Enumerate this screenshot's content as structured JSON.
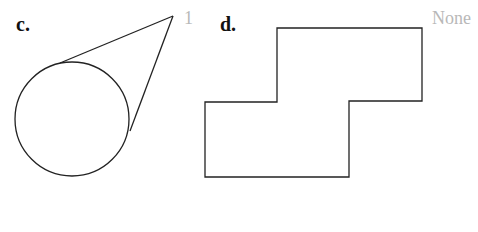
{
  "figures": [
    {
      "label": "c.",
      "answer": "1",
      "shape": "circle-with-two-tangent-lines",
      "circle": {
        "cx": 72,
        "cy": 119,
        "r": 57
      },
      "apex": [
        173,
        16
      ],
      "tangent_points": [
        [
          60,
          63
        ],
        [
          130,
          131
        ]
      ]
    },
    {
      "label": "d.",
      "answer": "None",
      "shape": "rectilinear-polygon",
      "points": "277,28 422,28 422,101 349,101 349,177 205,177 205,102 277,102"
    }
  ],
  "colors": {
    "stroke": "#222222",
    "answer_text": "#b8b8b8"
  }
}
